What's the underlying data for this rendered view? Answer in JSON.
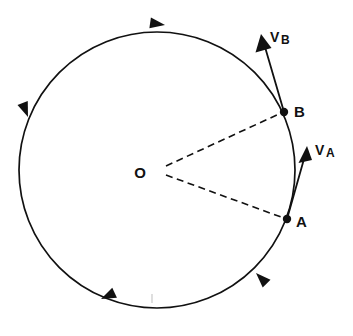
{
  "figure": {
    "kind": "circular-motion-velocity-vector-diagram",
    "background_color": "#ffffff",
    "ink_color": "#111111",
    "width": 353,
    "height": 336
  },
  "labels": {
    "center": "O",
    "point_a": "A",
    "point_b": "B",
    "vector_a_symbol": "V",
    "vector_a_subscript": "A",
    "vector_b_symbol": "V",
    "vector_b_subscript": "B"
  },
  "geometry": {
    "circle": {
      "center_x": 157,
      "center_y": 170,
      "radius": 138,
      "stroke_width": 1.7
    },
    "point_a": {
      "x": 287,
      "y": 219,
      "dot_radius": 4.2
    },
    "point_b": {
      "x": 284,
      "y": 112,
      "dot_radius": 4.2
    },
    "center_point": {
      "x": 158,
      "y": 171
    },
    "vector_a": {
      "tail_x": 287,
      "tail_y": 219,
      "tip_x": 307,
      "tip_y": 146,
      "head_length": 17,
      "head_width": 9
    },
    "vector_b": {
      "tail_x": 284,
      "tail_y": 112,
      "tip_x": 261,
      "tip_y": 34,
      "head_length": 17,
      "head_width": 9
    },
    "dashed_radius_to_a": {
      "x1": 166,
      "y1": 175,
      "x2": 281,
      "y2": 217
    },
    "dashed_radius_to_b": {
      "x1": 166,
      "y1": 166,
      "x2": 279,
      "y2": 114
    },
    "faint_tick": {
      "x": 152,
      "y1": 294,
      "y2": 303
    }
  },
  "motion": {
    "sense": "counterclockwise",
    "direction_arrow_count": 4,
    "direction_arrows": [
      {
        "name": "arrow-top",
        "x": 165,
        "y": 25,
        "angle_deg": 188
      },
      {
        "name": "arrow-left",
        "x": 28,
        "y": 117,
        "angle_deg": 249
      },
      {
        "name": "arrow-bottom-left",
        "x": 101,
        "y": 299,
        "angle_deg": 335
      },
      {
        "name": "arrow-bottom-right",
        "x": 256,
        "y": 273,
        "angle_deg": 45
      }
    ]
  },
  "label_positions": {
    "center": {
      "x": 140,
      "y": 178
    },
    "point_a": {
      "x": 296,
      "y": 227
    },
    "point_b": {
      "x": 294,
      "y": 117
    },
    "vector_a": {
      "x": 315,
      "y": 155
    },
    "vector_b": {
      "x": 270,
      "y": 42
    }
  }
}
